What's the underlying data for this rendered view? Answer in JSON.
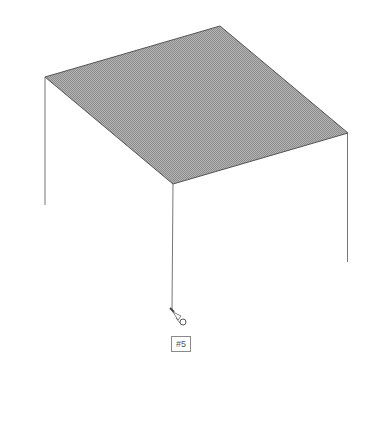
{
  "diagram": {
    "type": "3d-isometric-plate",
    "plate": {
      "corners": [
        [
          45,
          77
        ],
        [
          220,
          26
        ],
        [
          348,
          133
        ],
        [
          173,
          184
        ]
      ],
      "fill": "#a0a0a0",
      "edge_color": "#555555"
    },
    "legs": [
      {
        "x1": 45,
        "y1": 77,
        "x2": 45,
        "y2": 205
      },
      {
        "x1": 348,
        "y1": 133,
        "x2": 348,
        "y2": 262
      },
      {
        "x1": 173,
        "y1": 184,
        "x2": 173,
        "y2": 310
      }
    ],
    "leg_color": "#777777",
    "marker": {
      "icon": "probe-cursor-icon",
      "x": 172,
      "y": 310
    },
    "label": {
      "text": "#5"
    }
  }
}
